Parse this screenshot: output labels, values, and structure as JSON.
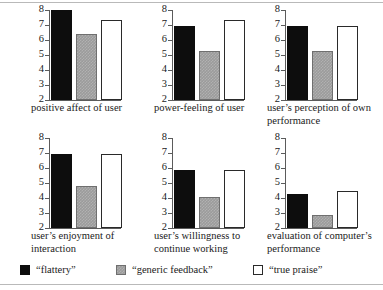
{
  "figure": {
    "name": "grouped-bar-panels",
    "background": "#ffffff",
    "rule_color": "#b9b9b9"
  },
  "legend": {
    "position": "bottom-left",
    "items": [
      {
        "label": "“flattery”",
        "color": "#0d0d0d",
        "key": "flattery"
      },
      {
        "label": "“generic feedback”",
        "color": "#9b9b9b",
        "key": "generic"
      },
      {
        "label": "“true praise”",
        "color": "#ffffff",
        "key": "truepraise"
      }
    ]
  },
  "axis": {
    "ticks": [
      "8",
      "7",
      "6",
      "5",
      "4",
      "3",
      "2"
    ],
    "ymin": 2,
    "ymax": 8
  },
  "chart_data": [
    {
      "type": "bar",
      "title": "positive affect of user",
      "xlabel": "",
      "ylabel": "",
      "ylim": [
        2,
        8
      ],
      "yticks": [
        2,
        3,
        4,
        5,
        6,
        7,
        8
      ],
      "grid": false,
      "categories": [
        "“flattery”",
        "“generic feedback”",
        "“true praise”"
      ],
      "values": [
        8.0,
        6.4,
        7.35
      ]
    },
    {
      "type": "bar",
      "title": "power-feeling of user",
      "xlabel": "",
      "ylabel": "",
      "ylim": [
        2,
        8
      ],
      "yticks": [
        2,
        3,
        4,
        5,
        6,
        7,
        8
      ],
      "grid": false,
      "categories": [
        "“flattery”",
        "“generic feedback”",
        "“true praise”"
      ],
      "values": [
        6.95,
        5.25,
        7.35
      ]
    },
    {
      "type": "bar",
      "title": "user’s perception of own performance",
      "xlabel": "",
      "ylabel": "",
      "ylim": [
        2,
        8
      ],
      "yticks": [
        2,
        3,
        4,
        5,
        6,
        7,
        8
      ],
      "grid": false,
      "categories": [
        "“flattery”",
        "“generic feedback”",
        "“true praise”"
      ],
      "values": [
        6.95,
        5.3,
        6.95
      ]
    },
    {
      "type": "bar",
      "title": "user’s enjoyment of interaction",
      "xlabel": "",
      "ylabel": "",
      "ylim": [
        2,
        8
      ],
      "yticks": [
        2,
        3,
        4,
        5,
        6,
        7,
        8
      ],
      "grid": false,
      "categories": [
        "“flattery”",
        "“generic feedback”",
        "“true praise”"
      ],
      "values": [
        6.95,
        4.8,
        6.95
      ]
    },
    {
      "type": "bar",
      "title": "user’s willingness to continue working",
      "xlabel": "",
      "ylabel": "",
      "ylim": [
        2,
        8
      ],
      "yticks": [
        2,
        3,
        4,
        5,
        6,
        7,
        8
      ],
      "grid": false,
      "categories": [
        "“flattery”",
        "“generic feedback”",
        "“true praise”"
      ],
      "values": [
        5.85,
        4.05,
        5.85
      ]
    },
    {
      "type": "bar",
      "title": "evaluation of computer’s performance",
      "xlabel": "",
      "ylabel": "",
      "ylim": [
        2,
        8
      ],
      "yticks": [
        2,
        3,
        4,
        5,
        6,
        7,
        8
      ],
      "grid": false,
      "categories": [
        "“flattery”",
        "“generic feedback”",
        "“true praise”"
      ],
      "values": [
        4.3,
        2.9,
        4.45
      ]
    }
  ]
}
